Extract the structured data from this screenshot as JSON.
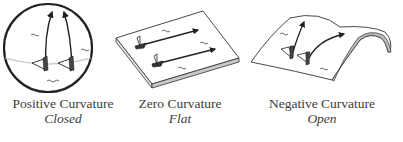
{
  "panels": [
    {
      "id": "positive",
      "shape": "sphere",
      "title": "Positive Curvature",
      "subtitle": "Closed"
    },
    {
      "id": "zero",
      "shape": "flat-slab",
      "title": "Zero Curvature",
      "subtitle": "Flat"
    },
    {
      "id": "negative",
      "shape": "saddle",
      "title": "Negative Curvature",
      "subtitle": "Open"
    }
  ],
  "colors": {
    "line": "#2a2a2a",
    "equator": "#bdbdbd",
    "slab_side": "#cfcfcf",
    "text": "#3c3c3c"
  }
}
